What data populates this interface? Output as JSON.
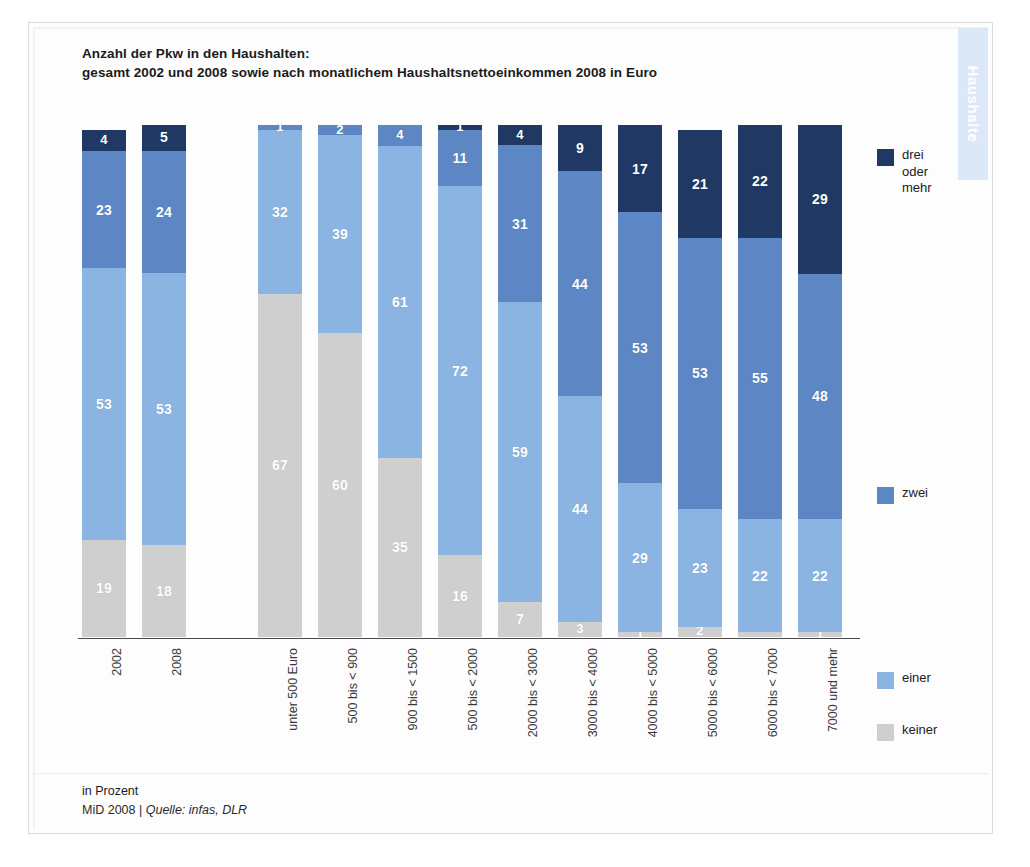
{
  "header": {
    "title_line1": "Anzahl der  Pkw in den Haushalten:",
    "title_line2": "gesamt 2002 und 2008 sowie nach monatlichem Haushaltsnettoeinkommen 2008 in Euro",
    "side_tab_label": "Haushalte"
  },
  "footer": {
    "unit": "in Prozent",
    "source_prefix": "MiD 2008 | ",
    "source_em": "Quelle: infas, DLR"
  },
  "legend": {
    "items": [
      {
        "label": "drei\noder\nmehr",
        "color": "#1f3864"
      },
      {
        "label": "zwei",
        "color": "#5c87c4"
      },
      {
        "label": "einer",
        "color": "#8cb4e2"
      },
      {
        "label": "keiner",
        "color": "#cfcfcf"
      }
    ]
  },
  "chart_data": {
    "type": "bar",
    "stacked": true,
    "title": "Anzahl der  Pkw in den Haushalten: gesamt 2002 und 2008 sowie nach monatlichem Haushaltsnettoeinkommen 2008 in Euro",
    "xlabel": "",
    "ylabel": "in Prozent",
    "ylim": [
      0,
      100
    ],
    "grid": false,
    "legend_position": "right",
    "categories": [
      "2002",
      "2008",
      "unter 500 Euro",
      "500 bis < 900",
      "900 bis < 1500",
      "500 bis < 2000",
      "2000 bis < 3000",
      "3000 bis < 4000",
      "4000 bis < 5000",
      "5000 bis < 6000",
      "6000 bis < 7000",
      "7000 und mehr"
    ],
    "series": [
      {
        "name": "keiner",
        "color": "#cfcfcf",
        "values": [
          19,
          18,
          67,
          60,
          35,
          16,
          7,
          3,
          1,
          2,
          1,
          1
        ]
      },
      {
        "name": "einer",
        "color": "#8cb4e2",
        "values": [
          53,
          53,
          32,
          39,
          61,
          72,
          59,
          44,
          29,
          23,
          22,
          22
        ]
      },
      {
        "name": "zwei",
        "color": "#5c87c4",
        "values": [
          23,
          24,
          1,
          2,
          4,
          11,
          31,
          44,
          53,
          53,
          55,
          48
        ]
      },
      {
        "name": "drei oder mehr",
        "color": "#1f3864",
        "values": [
          4,
          5,
          0,
          0,
          0,
          1,
          4,
          9,
          17,
          21,
          22,
          29
        ]
      }
    ],
    "labels_shown": {
      "keiner": [
        "19",
        "18",
        "67",
        "60",
        "35",
        "16",
        "7",
        "3",
        "1",
        "2",
        "",
        "1"
      ],
      "einer": [
        "53",
        "53",
        "32",
        "39",
        "61",
        "72",
        "59",
        "44",
        "29",
        "23",
        "22",
        "22"
      ],
      "zwei": [
        "23",
        "24",
        "1",
        "2",
        "4",
        "11",
        "31",
        "44",
        "53",
        "53",
        "55",
        "48"
      ],
      "drei oder mehr": [
        "4",
        "5",
        "",
        "",
        "",
        "1",
        "4",
        "9",
        "17",
        "21",
        "22",
        "29"
      ]
    },
    "group_gap_after_index": 1
  }
}
